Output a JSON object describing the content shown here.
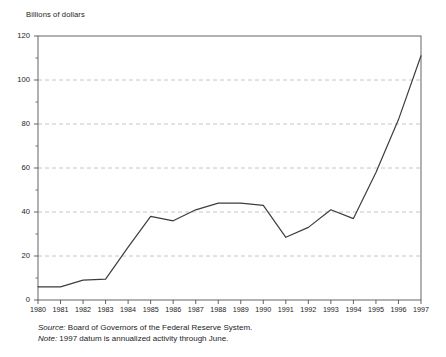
{
  "chart_data": {
    "type": "line",
    "title": "",
    "ylabel": "Billions of dollars",
    "xlabel": "",
    "categories": [
      "1980",
      "1981",
      "1982",
      "1983",
      "1984",
      "1985",
      "1986",
      "1987",
      "1988",
      "1989",
      "1990",
      "1991",
      "1992",
      "1993",
      "1994",
      "1995",
      "1996",
      "1997"
    ],
    "values": [
      6,
      6,
      9,
      9.5,
      24,
      38,
      36,
      41,
      44,
      44,
      43,
      28.5,
      33,
      41,
      37,
      58,
      82,
      111
    ],
    "series": [
      {
        "name": "Activity",
        "values": [
          6,
          6,
          9,
          9.5,
          24,
          38,
          36,
          41,
          44,
          44,
          43,
          28.5,
          33,
          41,
          37,
          58,
          82,
          111
        ]
      }
    ],
    "ylim": [
      0,
      120
    ],
    "ytick_values": [
      0,
      20,
      40,
      60,
      80,
      100,
      120
    ],
    "ytick_labels": [
      "0",
      "20",
      "40",
      "60",
      "80",
      "100",
      "120"
    ],
    "yminor_values": [
      10,
      30,
      50,
      70,
      90,
      110
    ],
    "xtick_labels": [
      "1980",
      "1981",
      "1982",
      "1983",
      "1984",
      "1985",
      "1986",
      "1987",
      "1988",
      "1989",
      "1990",
      "1991",
      "1992",
      "1993",
      "1994",
      "1995",
      "1996",
      "1997"
    ],
    "grid": "horizontal-dashed",
    "legend": "none",
    "line_color": "#3d3d3d",
    "grid_color": "#b8b8b8",
    "axis_color": "#555555"
  },
  "footnotes": {
    "source_label": "Source:",
    "source_text": " Board of Governors of the Federal Reserve System.",
    "note_label": "Note:",
    "note_text": " 1997 datum is annualized activity through June."
  }
}
